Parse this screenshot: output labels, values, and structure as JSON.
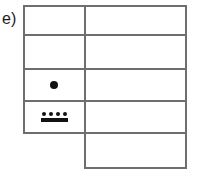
{
  "figure": {
    "label": "e)",
    "line_color": "#6e6e6e",
    "mark_color": "#121212",
    "background": "#ffffff",
    "grid": {
      "columns": 2,
      "rows": 5,
      "left_column_rows": 4,
      "right_column_rows": 5,
      "left": 23,
      "top": 5,
      "right": 187,
      "bottom": 168,
      "divider_x": 84,
      "row_dividers_y": [
        34,
        68,
        100,
        132
      ],
      "left_column_bottom_y": 132
    },
    "cells": [
      {
        "row": 1,
        "column": "left",
        "content": "",
        "marker": "none"
      },
      {
        "row": 1,
        "column": "right",
        "content": "",
        "marker": "none"
      },
      {
        "row": 2,
        "column": "left",
        "content": "",
        "marker": "none"
      },
      {
        "row": 2,
        "column": "right",
        "content": "",
        "marker": "none"
      },
      {
        "row": 3,
        "column": "left",
        "content": "",
        "marker": "single-dot"
      },
      {
        "row": 3,
        "column": "right",
        "content": "",
        "marker": "none"
      },
      {
        "row": 4,
        "column": "left",
        "content": "",
        "marker": "four-dots-over-bar"
      },
      {
        "row": 4,
        "column": "right",
        "content": "",
        "marker": "none"
      },
      {
        "row": 5,
        "column": "right",
        "content": "",
        "marker": "none"
      }
    ],
    "markers": {
      "single_dot": {
        "count": 1,
        "diameter_px": 8
      },
      "four_dots_over_bar": {
        "dot_count": 4,
        "dot_diameter_px": 4,
        "bar_width_px": 27,
        "bar_height_px": 4
      }
    }
  }
}
